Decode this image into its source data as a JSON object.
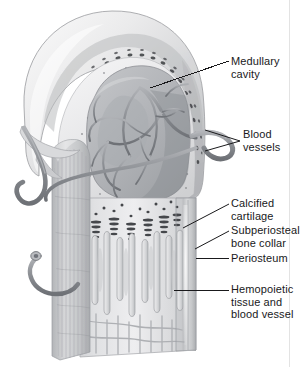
{
  "figure": {
    "view": "cut-away longitudinal section of the proximal end of a developing long bone",
    "canvas": {
      "width": 301,
      "height": 367
    },
    "background_color": "#ffffff",
    "ink_color": "#19191b",
    "palette": {
      "cartilage_light": "#e9e9ea",
      "cartilage_mid": "#cfd0d2",
      "cartilage_shadow": "#a9abae",
      "bone_collar": "#b8babc",
      "periosteum": "#c3c5c7",
      "trabecula": "#d6d7d9",
      "marrow_cavity": "#b4b6b9",
      "vessel": "#8d9095",
      "vessel_dark": "#74777c",
      "chondrocyte_dark": "#4a4c50",
      "leader_line": "#19191b"
    }
  },
  "labels": [
    {
      "id": "medullary",
      "name": "medullary-cavity",
      "lines": [
        "Medullary",
        "cavity"
      ],
      "text": "Medullary cavity",
      "position": {
        "x": 231,
        "y": 55
      },
      "leader": {
        "type": "line",
        "from": [
          229,
          61
        ],
        "to": [
          150,
          88
        ]
      }
    },
    {
      "id": "vessels",
      "name": "blood-vessels",
      "lines": [
        "Blood",
        "vessels"
      ],
      "text": "Blood vessels",
      "position": {
        "x": 243,
        "y": 128
      },
      "leader": {
        "type": "bracket",
        "apex": [
          240,
          141
        ],
        "prongs": [
          [
            205,
            130
          ],
          [
            205,
            151
          ]
        ]
      }
    },
    {
      "id": "calcified",
      "name": "calcified-cartilage",
      "lines": [
        "Calcified",
        "cartilage"
      ],
      "text": "Calcified cartilage",
      "position": {
        "x": 231,
        "y": 197
      },
      "leader": {
        "type": "line",
        "from": [
          229,
          204
        ],
        "to": [
          183,
          228
        ]
      }
    },
    {
      "id": "subperiosteal",
      "name": "subperiosteal-bone-collar",
      "lines": [
        "Subperiosteal",
        "bone collar"
      ],
      "text": "Subperiosteal bone collar",
      "position": {
        "x": 231,
        "y": 224
      },
      "leader": {
        "type": "line",
        "from": [
          229,
          231
        ],
        "to": [
          195,
          249
        ]
      }
    },
    {
      "id": "periosteum",
      "name": "periosteum",
      "lines": [
        "Periosteum"
      ],
      "text": "Periosteum",
      "position": {
        "x": 231,
        "y": 252
      },
      "leader": {
        "type": "line",
        "from": [
          229,
          258
        ],
        "to": [
          196,
          258
        ]
      }
    },
    {
      "id": "hemopoietic",
      "name": "hemopoietic-tissue-and-blood-vessel",
      "lines": [
        "Hemopoietic",
        "tissue and",
        "blood vessel"
      ],
      "text": "Hemopoietic tissue and blood vessel",
      "position": {
        "x": 231,
        "y": 283
      },
      "leader": {
        "type": "line",
        "from": [
          229,
          290
        ],
        "to": [
          174,
          290
        ]
      }
    }
  ],
  "structures": [
    {
      "name": "epiphyseal-cartilage-dome",
      "description": "Smooth pale hyaline cartilage cap forming the rounded proximal end"
    },
    {
      "name": "chondrocyte-band",
      "description": "Curved band of dark clustered hypertrophic chondrocytes beneath the cartilage surface"
    },
    {
      "name": "spongy-bone-border",
      "description": "Stippled trabecular bone lining the marrow cavity"
    },
    {
      "name": "marrow-cavity",
      "description": "Central darker medullary cavity containing vascular network"
    },
    {
      "name": "vascular-network",
      "description": "Branching nutrient vessels inside the medullary cavity"
    },
    {
      "name": "nutrient-vessel-entry",
      "description": "Large vessel entering through the bone collar on the right"
    },
    {
      "name": "calcified-cartilage-spicules",
      "description": "Row of dark stacked spicules at the metaphysis"
    },
    {
      "name": "bone-trabeculae",
      "description": "Vertical columns of primary spongiosa in the diaphysis"
    },
    {
      "name": "bone-collar",
      "description": "Dense subperiosteal bone collar on the shaft walls"
    },
    {
      "name": "periosteum-sheath",
      "description": "Striated fibrous sheath wrapping the diaphysis"
    },
    {
      "name": "periosteal-vessels",
      "description": "Two vessels coursing over the periosteum on the left"
    }
  ]
}
